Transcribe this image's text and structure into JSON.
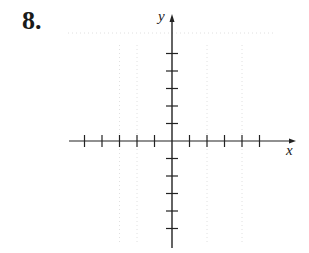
{
  "problem": {
    "number": "8."
  },
  "graph": {
    "x_axis_label": "x",
    "y_axis_label": "y",
    "x_ticks_negative": 5,
    "x_ticks_positive": 5,
    "y_ticks_positive": 5,
    "y_ticks_negative": 5,
    "axis_color": "#222222",
    "grid_color": "#d8d8d8"
  }
}
